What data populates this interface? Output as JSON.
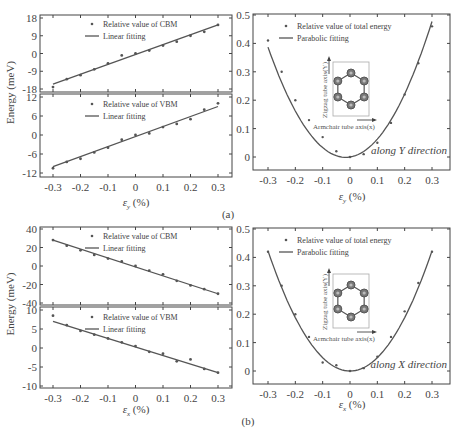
{
  "chart_data": [
    {
      "panel": "a-left-top",
      "type": "scatter",
      "series": [
        {
          "name": "Relative value of CBM",
          "x": [
            -0.3,
            -0.25,
            -0.2,
            -0.15,
            -0.1,
            -0.05,
            0,
            0.05,
            0.1,
            0.15,
            0.2,
            0.25,
            0.3
          ],
          "values": [
            -17,
            -13,
            -11,
            -8,
            -5,
            -1,
            0,
            1.5,
            4,
            6,
            9,
            11,
            14.5
          ]
        },
        {
          "name": "Linear fitting",
          "x": [
            -0.3,
            0.3
          ],
          "values": [
            -15.5,
            14.5
          ]
        }
      ],
      "yticks": [
        "18",
        "9",
        "0",
        "-9",
        "-18"
      ],
      "ylim": [
        -18,
        18
      ]
    },
    {
      "panel": "a-left-bottom",
      "type": "scatter",
      "series": [
        {
          "name": "Relative value of VBM",
          "x": [
            -0.3,
            -0.25,
            -0.2,
            -0.15,
            -0.1,
            -0.05,
            0,
            0.05,
            0.1,
            0.15,
            0.2,
            0.25,
            0.3
          ],
          "values": [
            -10.5,
            -8.5,
            -7.5,
            -5.5,
            -4,
            -1.5,
            0,
            0.5,
            2.5,
            3.5,
            5,
            8,
            10
          ]
        },
        {
          "name": "Linear fitting",
          "x": [
            -0.3,
            0.3
          ],
          "values": [
            -10,
            9
          ]
        }
      ],
      "yticks": [
        "12",
        "6",
        "0",
        "-6",
        "-12"
      ],
      "ylim": [
        -12,
        12
      ],
      "xticks": [
        "-0.3",
        "-0.2",
        "-0.1",
        "0",
        "0.1",
        "0.2",
        "0.3"
      ],
      "xlabel": "ε_y (%)",
      "ylabel": "Energy (meV)"
    },
    {
      "panel": "a-right",
      "type": "scatter",
      "series": [
        {
          "name": "Relative value of total energy",
          "x": [
            -0.3,
            -0.25,
            -0.2,
            -0.15,
            -0.1,
            -0.05,
            0,
            0.05,
            0.1,
            0.15,
            0.2,
            0.25,
            0.3
          ],
          "values": [
            0.41,
            0.3,
            0.2,
            0.13,
            0.07,
            0.02,
            0,
            0.01,
            0.05,
            0.12,
            0.22,
            0.33,
            0.46
          ]
        },
        {
          "name": "Parabolic fitting"
        }
      ],
      "yticks": [
        "0.5",
        "0.4",
        "0.3",
        "0.2",
        "0.1",
        "0"
      ],
      "ylim": [
        0,
        0.5
      ],
      "xticks": [
        "-0.3",
        "-0.2",
        "-0.1",
        "0",
        "0.1",
        "0.2",
        "0.3"
      ],
      "xlabel": "ε_y (%)",
      "annotation": "along Y direction"
    },
    {
      "panel": "b-left-top",
      "type": "scatter",
      "series": [
        {
          "name": "Relative value of CBM",
          "x": [
            -0.3,
            -0.25,
            -0.2,
            -0.15,
            -0.1,
            -0.05,
            0,
            0.05,
            0.1,
            0.15,
            0.2,
            0.25,
            0.3
          ],
          "values": [
            28,
            22,
            17,
            12,
            8,
            5,
            0,
            -5,
            -9,
            -16,
            -21,
            -25,
            -30
          ]
        },
        {
          "name": "Linear fitting",
          "x": [
            -0.3,
            0.3
          ],
          "values": [
            28,
            -30
          ]
        }
      ],
      "yticks": [
        "40",
        "20",
        "0",
        "-20",
        "-40"
      ],
      "ylim": [
        -40,
        40
      ]
    },
    {
      "panel": "b-left-bottom",
      "type": "scatter",
      "series": [
        {
          "name": "Relative value of VBM",
          "x": [
            -0.3,
            -0.25,
            -0.2,
            -0.15,
            -0.1,
            -0.05,
            0,
            0.05,
            0.1,
            0.15,
            0.2,
            0.25,
            0.3
          ],
          "values": [
            8.5,
            6,
            4.5,
            3.5,
            2.5,
            1.5,
            0.5,
            -1,
            -1.5,
            -3.5,
            -3,
            -5.5,
            -6.5
          ]
        },
        {
          "name": "Linear fitting",
          "x": [
            -0.3,
            0.3
          ],
          "values": [
            7,
            -6.5
          ]
        }
      ],
      "yticks": [
        "10",
        "5",
        "0",
        "-5",
        "-10"
      ],
      "ylim": [
        -10,
        10
      ],
      "xticks": [
        "-0.3",
        "-0.2",
        "-0.1",
        "0",
        "0.1",
        "0.2",
        "0.3"
      ],
      "xlabel": "ε_x (%)",
      "ylabel": "Energy (meV)"
    },
    {
      "panel": "b-right",
      "type": "scatter",
      "series": [
        {
          "name": "Relative value of total energy",
          "x": [
            -0.3,
            -0.25,
            -0.2,
            -0.15,
            -0.1,
            -0.05,
            0,
            0.05,
            0.1,
            0.15,
            0.2,
            0.25,
            0.3
          ],
          "values": [
            0.42,
            0.3,
            0.2,
            0.12,
            0.03,
            0.02,
            0,
            0.01,
            0.05,
            0.12,
            0.21,
            0.31,
            0.42
          ]
        },
        {
          "name": "Parabolic fitting"
        }
      ],
      "yticks": [
        "0.5",
        "0.4",
        "0.3",
        "0.2",
        "0.1",
        "0"
      ],
      "ylim": [
        0,
        0.5
      ],
      "xticks": [
        "-0.3",
        "-0.2",
        "-0.1",
        "0",
        "0.1",
        "0.2",
        "0.3"
      ],
      "xlabel": "ε_x (%)",
      "annotation": "along X direction"
    }
  ],
  "labels": {
    "ylabel": "Energy (meV)",
    "cbm_legend": "Relative value of CBM",
    "vbm_legend": "Relative value of VBM",
    "linear_legend": "Linear fitting",
    "total_legend": "Relative value of total energy",
    "parabolic_legend": "Parabolic fitting",
    "xlabel_y": "ε",
    "xlabel_y_sub": "y",
    "xlabel_x": "ε",
    "xlabel_x_sub": "x",
    "pct": "(%)",
    "dir_y": "along Y direction",
    "dir_x": "along X direction",
    "zigzag": "Zigzag tube axis(Y)",
    "armchair": "Armchair tube axis(x)",
    "caption_a": "(a)",
    "caption_b": "(b)"
  },
  "ticks": {
    "x": [
      "-0.3",
      "-0.2",
      "-0.1",
      "0",
      "0.1",
      "0.2",
      "0.3"
    ],
    "a_cbm": [
      "18",
      "9",
      "0",
      "-9",
      "-18"
    ],
    "a_vbm": [
      "12",
      "6",
      "0",
      "-6",
      "-12"
    ],
    "b_cbm": [
      "40",
      "20",
      "0",
      "-20",
      "-40"
    ],
    "b_vbm": [
      "10",
      "5",
      "0",
      "-5",
      "-10"
    ],
    "total": [
      "0.5",
      "0.4",
      "0.3",
      "0.2",
      "0.1",
      "0"
    ]
  }
}
